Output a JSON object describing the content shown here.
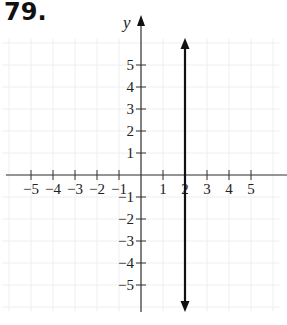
{
  "problem": {
    "number": "79."
  },
  "chart_data": {
    "type": "line",
    "title": "",
    "xlabel": "x",
    "ylabel": "y",
    "xlim": [
      -6,
      6
    ],
    "ylim": [
      -6,
      6
    ],
    "grid": true,
    "x_ticks": [
      -5,
      -4,
      -3,
      -2,
      -1,
      1,
      2,
      3,
      4,
      5
    ],
    "y_ticks": [
      -5,
      -4,
      -3,
      -2,
      -1,
      1,
      2,
      3,
      4,
      5
    ],
    "x_tick_labels": [
      "−5",
      "−4",
      "−3",
      "−2",
      "−1",
      "1",
      "2",
      "3",
      "4",
      "5"
    ],
    "y_tick_labels": [
      "−5",
      "−4",
      "−3",
      "−2",
      "−1",
      "1",
      "2",
      "3",
      "4",
      "5"
    ],
    "series": [
      {
        "name": "x = 2",
        "kind": "vertical-line",
        "x": [
          2,
          2
        ],
        "y": [
          -6,
          6
        ],
        "arrows": "both"
      }
    ]
  },
  "colors": {
    "axis": "#333333",
    "line": "#111111",
    "grid": "#eeeeee",
    "text": "#222222"
  }
}
